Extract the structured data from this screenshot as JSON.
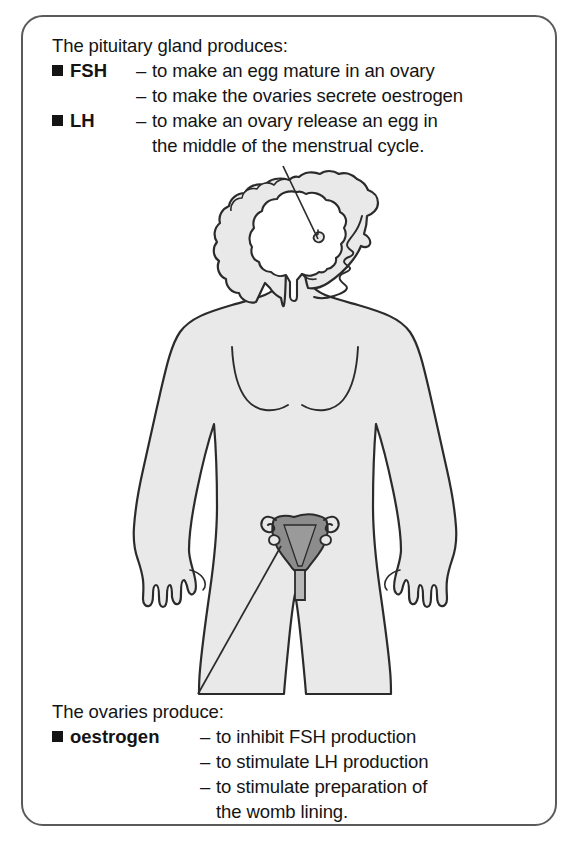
{
  "diagram": {
    "title_visible": false,
    "colors": {
      "frame_border": "#5a5a5a",
      "body_fill": "#e9e9e9",
      "body_outline": "#2b2b2b",
      "brain_fill": "#ffffff",
      "uterus_fill": "#8c8c8c",
      "text": "#141414",
      "leader_line": "#2b2b2b"
    }
  },
  "top_block": {
    "heading": "The pituitary gland produces:",
    "items": [
      {
        "bullet": "■",
        "term": "FSH",
        "lines": [
          {
            "dash": "–",
            "text": "to make an egg mature in an ovary"
          },
          {
            "dash": "–",
            "text": "to make the ovaries secrete oestrogen"
          }
        ]
      },
      {
        "bullet": "■",
        "term": "LH",
        "lines": [
          {
            "dash": "–",
            "text": "to make an ovary release an egg in"
          },
          {
            "dash": "",
            "text": "the middle of the menstrual cycle."
          }
        ]
      }
    ]
  },
  "bottom_block": {
    "heading": "The ovaries produce:",
    "items": [
      {
        "bullet": "■",
        "term": "oestrogen",
        "lines": [
          {
            "dash": "–",
            "text": "to inhibit FSH production"
          },
          {
            "dash": "–",
            "text": "to stimulate LH production"
          },
          {
            "dash": "–",
            "text": "to stimulate preparation of"
          },
          {
            "dash": "",
            "text": "the womb lining."
          }
        ]
      }
    ]
  },
  "figure": {
    "label_pituitary": "pituitary-gland",
    "label_ovaries": "ovaries-and-uterus",
    "label_body": "female-body-silhouette",
    "label_brain": "brain",
    "label_leader_top": "leader-line-to-pituitary",
    "label_leader_bottom": "leader-line-to-ovary"
  }
}
